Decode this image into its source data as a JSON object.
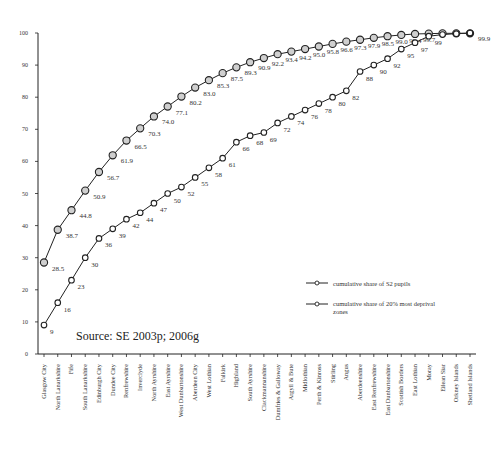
{
  "chart_data": {
    "type": "line",
    "title": "",
    "xlabel": "",
    "ylabel": "",
    "ylim": [
      0,
      100
    ],
    "yticks": [
      0,
      10,
      20,
      30,
      40,
      50,
      60,
      70,
      80,
      90,
      100
    ],
    "grid": false,
    "legend_position": "right-middle",
    "annotation": "Source: SE 2003p; 2006g",
    "categories": [
      "Glasgow City",
      "North Lanarkshire",
      "Fife",
      "South Lanarkshire",
      "Edinburgh City",
      "Dundee City",
      "Renfrewshire",
      "Inverclyde",
      "North Ayrshire",
      "East Ayrshire",
      "West Dunbartonshire",
      "Aberdeen City",
      "West Lothian",
      "Falkirk",
      "Highland",
      "South Ayrshire",
      "Clackmannanshire",
      "Dumfries & Galloway",
      "Argyll & Bute",
      "Midlothian",
      "Perth & Kinross",
      "Stirling",
      "Angus",
      "Aberdeenshire",
      "East Renfrewshire",
      "East Dunbartonshire",
      "Scottish Borders",
      "East Lothian",
      "Moray",
      "Eilean Siar",
      "Orkney Islands",
      "Shetland Islands"
    ],
    "series": [
      {
        "name": "cumulative share of S2 pupils",
        "marker": "circle-grey",
        "values": [
          28.5,
          38.7,
          44.8,
          50.9,
          56.7,
          61.9,
          66.5,
          70.3,
          74.0,
          77.1,
          80.2,
          83.0,
          85.3,
          87.5,
          89.3,
          90.9,
          92.2,
          93.4,
          94.2,
          95.0,
          95.8,
          96.6,
          97.3,
          97.9,
          98.5,
          99.0,
          99.4,
          99.7,
          99.8,
          99.9,
          99.9,
          99.9
        ],
        "labels": [
          "28.5",
          "38.7",
          "44.8",
          "50.9",
          "56.7",
          "61.9",
          "66.5",
          "70.3",
          "74.0",
          "77.1",
          "80.2",
          "83.0",
          "85.3",
          "87.5",
          "89.3",
          "90.9",
          "92.2",
          "93.4",
          "94.2",
          "95.0",
          "95.8",
          "96.6",
          "97.3",
          "97.9",
          "98.5",
          "99.0",
          "99.4",
          "99.7",
          "",
          "",
          "",
          "99.9"
        ]
      },
      {
        "name": "cumulative share of 20% most deprival zones",
        "marker": "circle-white",
        "values": [
          9,
          16,
          23,
          30,
          36,
          39,
          42,
          44,
          47,
          50,
          52,
          55,
          58,
          61,
          66,
          68,
          69,
          72,
          74,
          76,
          78,
          80,
          82,
          88,
          90,
          92,
          95,
          97,
          99,
          99.5,
          99.8,
          100
        ],
        "labels": [
          "9",
          "16",
          "23",
          "30",
          "36",
          "39",
          "42",
          "44",
          "47",
          "50",
          "52",
          "55",
          "58",
          "61",
          "66",
          "68",
          "69",
          "72",
          "74",
          "76",
          "78",
          "80",
          "82",
          "88",
          "90",
          "92",
          "95",
          "97",
          "99",
          "",
          "",
          ""
        ]
      }
    ]
  },
  "legend": {
    "items": [
      {
        "label_line1": "cumulative share of S2 pupils",
        "label_line2": ""
      },
      {
        "label_line1": "cumulative share of 20% most deprival",
        "label_line2": "zones"
      }
    ]
  },
  "source_text": "Source: SE 2003p; 2006g"
}
